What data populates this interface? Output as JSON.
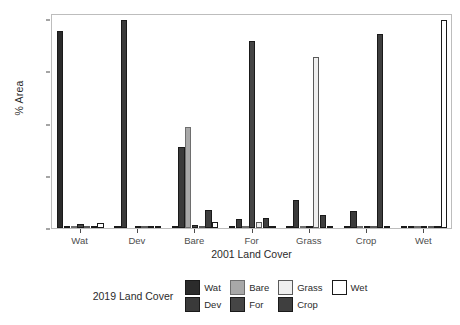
{
  "chart_data": {
    "type": "bar",
    "title": "",
    "xlabel": "2001 Land Cover",
    "ylabel": "% Area",
    "ylim": [
      0,
      103
    ],
    "yticks": [
      0,
      25,
      50,
      75,
      100
    ],
    "ytick_labels": [
      "0",
      "25",
      "50",
      "75",
      "100"
    ],
    "grid": false,
    "legend_position": "bottom",
    "legend_title": "2019 Land Cover",
    "categories": [
      "Wat",
      "Dev",
      "Bare",
      "For",
      "Grass",
      "Crop",
      "Wet"
    ],
    "series": [
      {
        "name": "Wat",
        "color": "#2b2b2b",
        "border": "#1a1a1a",
        "values": [
          94.2,
          0.2,
          1.0,
          0.2,
          1.1,
          0.2,
          0.3
        ]
      },
      {
        "name": "Dev",
        "color": "#3a3a3a",
        "border": "#1a1a1a",
        "values": [
          1.1,
          99.8,
          39.0,
          4.2,
          13.2,
          8.0,
          0.2
        ]
      },
      {
        "name": "Bare",
        "color": "#a8a8a8",
        "border": "#6e6e6e",
        "values": [
          0.3,
          0.0,
          48.5,
          0.3,
          0.4,
          0.2,
          0.1
        ]
      },
      {
        "name": "For",
        "color": "#454545",
        "border": "#1a1a1a",
        "values": [
          2.0,
          0.1,
          1.3,
          89.5,
          0.5,
          0.4,
          0.2
        ]
      },
      {
        "name": "Grass",
        "color": "#efefef",
        "border": "#5a5a5a",
        "values": [
          0.6,
          0.1,
          0.6,
          3.0,
          82.0,
          0.3,
          0.2
        ]
      },
      {
        "name": "Crop",
        "color": "#3f3f3f",
        "border": "#1a1a1a",
        "values": [
          0.3,
          0.1,
          8.8,
          4.9,
          6.2,
          92.9,
          0.2
        ]
      },
      {
        "name": "Wet",
        "color": "#ffffff",
        "border": "#1a1a1a",
        "values": [
          2.2,
          0.1,
          3.0,
          0.8,
          0.9,
          0.3,
          99.5
        ]
      }
    ]
  },
  "legend": {
    "title": "2019 Land Cover",
    "items": [
      {
        "label": "Wat",
        "swatch": "#2b2b2b",
        "border": "#1a1a1a"
      },
      {
        "label": "Bare",
        "swatch": "#a8a8a8",
        "border": "#6e6e6e"
      },
      {
        "label": "Grass",
        "swatch": "#efefef",
        "border": "#5a5a5a"
      },
      {
        "label": "Wet",
        "swatch": "#ffffff",
        "border": "#1a1a1a"
      },
      {
        "label": "Dev",
        "swatch": "#3a3a3a",
        "border": "#1a1a1a"
      },
      {
        "label": "For",
        "swatch": "#454545",
        "border": "#1a1a1a"
      },
      {
        "label": "Crop",
        "swatch": "#3f3f3f",
        "border": "#1a1a1a"
      }
    ]
  }
}
